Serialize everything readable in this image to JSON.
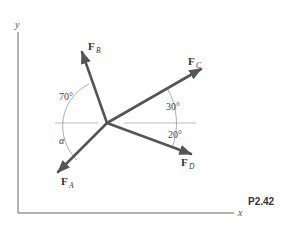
{
  "diagram": {
    "problem_label": "P2.42",
    "axes": {
      "x_label": "x",
      "y_label": "y"
    },
    "forces": [
      {
        "name": "F",
        "subscript": "A",
        "direction": "down-left",
        "angle_label": "α"
      },
      {
        "name": "F",
        "subscript": "B",
        "direction": "up-left",
        "angle_label": "70°"
      },
      {
        "name": "F",
        "subscript": "C",
        "direction": "up-right",
        "angle_label": "30°"
      },
      {
        "name": "F",
        "subscript": "D",
        "direction": "down-right",
        "angle_label": "20°"
      }
    ],
    "angles": {
      "fb_from_horizontal_left": "70°",
      "fc_above_horizontal_right": "30°",
      "fd_below_horizontal_right": "20°",
      "fa_below_horizontal_left": "α"
    },
    "colors": {
      "vector": "#555555",
      "axis": "#666666",
      "reference_line": "#bbbbbb",
      "arc": "#999999",
      "text": "#333333"
    }
  }
}
